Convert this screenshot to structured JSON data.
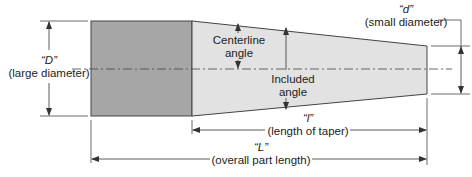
{
  "diagram": {
    "type": "taper-dimension-diagram",
    "labels": {
      "large_symbol": "“D”",
      "large_desc": "(large diameter)",
      "small_symbol": "“d”",
      "small_desc": "(small diameter)",
      "centerline_angle_1": "Centerline",
      "centerline_angle_2": "angle",
      "included_angle_1": "Included",
      "included_angle_2": "angle",
      "taper_symbol": "“l”",
      "taper_desc": "(length of taper)",
      "overall_symbol": "“L”",
      "overall_desc": "(overall part length)"
    },
    "colors": {
      "cylinder_fill": "#a6a6a6",
      "taper_fill": "#e2e2e2",
      "line": "#333333"
    }
  }
}
